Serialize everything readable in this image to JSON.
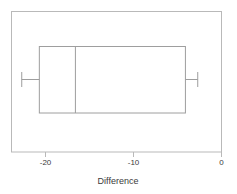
{
  "chart_data": {
    "type": "boxplot",
    "title": "",
    "xlabel": "Difference",
    "ylabel": "",
    "orientation": "horizontal",
    "xlim": [
      -24.0,
      0.5
    ],
    "xticks": [
      -20,
      -10,
      0
    ],
    "xticklabels": [
      "-20",
      "-10",
      "0"
    ],
    "grid": false,
    "legend": null,
    "frame": true,
    "boxes": [
      {
        "name": "Difference",
        "lower_whisker": -22.7,
        "q1": -20.7,
        "median": -16.6,
        "q3": -4.1,
        "upper_whisker": -2.7,
        "outliers": []
      }
    ]
  },
  "axis": {
    "title": "Difference",
    "ticks": [
      {
        "label": "-20",
        "value": -20
      },
      {
        "label": "-10",
        "value": -10
      },
      {
        "label": "0",
        "value": 0
      }
    ]
  },
  "style": {
    "line_color": "#9a9a9a",
    "frame_color": "#b5b5b5",
    "text_color": "#3a3a3a",
    "background": "#ffffff"
  }
}
